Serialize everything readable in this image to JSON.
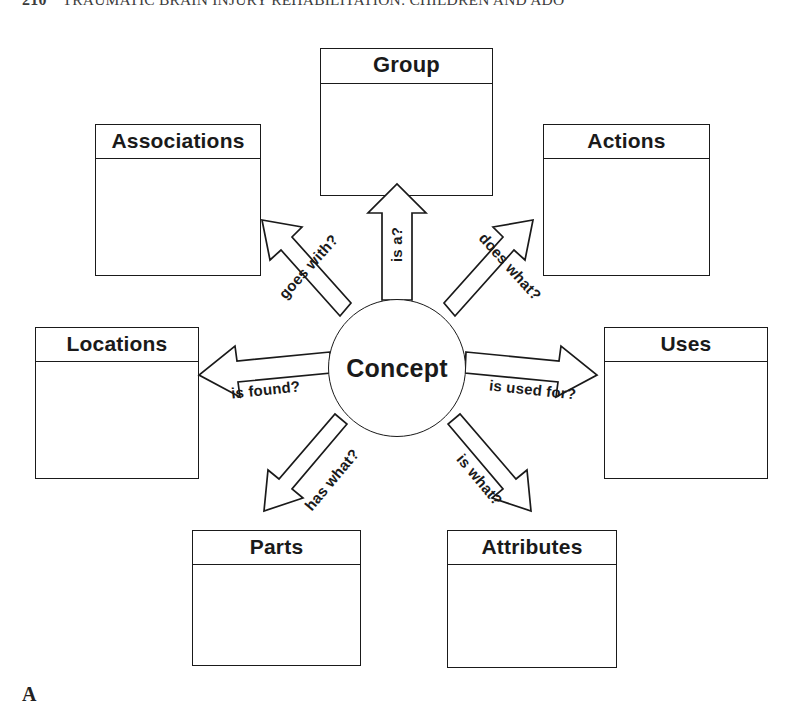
{
  "page": {
    "running_head": {
      "page_number": "210",
      "title": "TRAUMATIC BRAIN INJURY REHABILITATION: CHILDREN AND ADO"
    },
    "figure_letter": "A"
  },
  "diagram": {
    "type": "concept-map",
    "center": {
      "label": "Concept"
    },
    "nodes": [
      {
        "id": "group",
        "title": "Group",
        "body": ""
      },
      {
        "id": "associations",
        "title": "Associations",
        "body": ""
      },
      {
        "id": "actions",
        "title": "Actions",
        "body": ""
      },
      {
        "id": "locations",
        "title": "Locations",
        "body": ""
      },
      {
        "id": "uses",
        "title": "Uses",
        "body": ""
      },
      {
        "id": "parts",
        "title": "Parts",
        "body": ""
      },
      {
        "id": "attributes",
        "title": "Attributes",
        "body": ""
      }
    ],
    "relations": [
      {
        "id": "is-a",
        "label": "is a?",
        "from": "concept",
        "to": "group",
        "direction": "up"
      },
      {
        "id": "goes-with",
        "label": "goes with?",
        "from": "concept",
        "to": "associations",
        "direction": "up-left"
      },
      {
        "id": "does-what",
        "label": "does what?",
        "from": "concept",
        "to": "actions",
        "direction": "up-right"
      },
      {
        "id": "is-found",
        "label": "is found?",
        "from": "concept",
        "to": "locations",
        "direction": "left"
      },
      {
        "id": "is-used-for",
        "label": "is used for?",
        "from": "concept",
        "to": "uses",
        "direction": "right"
      },
      {
        "id": "has-what",
        "label": "has what?",
        "from": "concept",
        "to": "parts",
        "direction": "down-left"
      },
      {
        "id": "is-what",
        "label": "is what?",
        "from": "concept",
        "to": "attributes",
        "direction": "down-right"
      }
    ],
    "colors": {
      "stroke": "#1a1a1a",
      "fill": "#ffffff",
      "background": "#ffffff"
    }
  }
}
